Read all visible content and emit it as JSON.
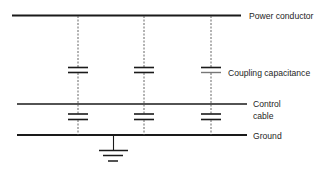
{
  "diagram": {
    "labels": {
      "power_conductor": "Power conductor",
      "coupling_capacitance": "Coupling capacitance",
      "control_cable_line1": "Control",
      "control_cable_line2": "cable",
      "ground": "Ground"
    },
    "columns": [
      78,
      144,
      211
    ],
    "colors": {
      "line": "#1a1a1a",
      "dashed": "#555555",
      "text": "#1e1e1e"
    }
  }
}
